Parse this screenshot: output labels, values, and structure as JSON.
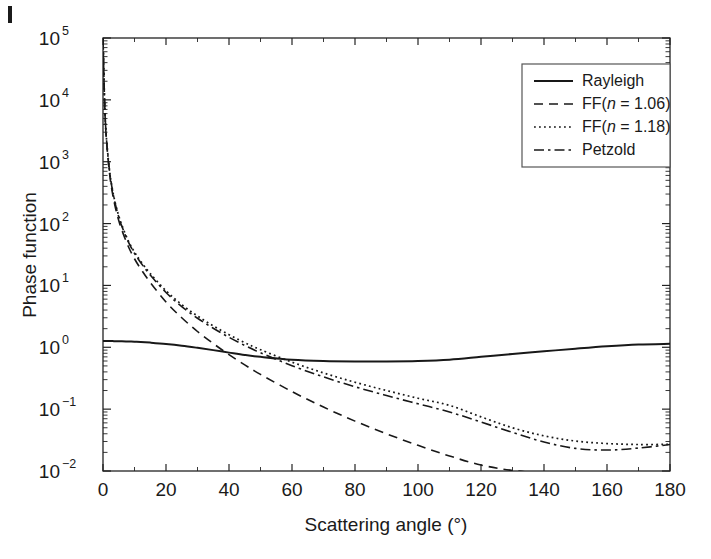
{
  "figure": {
    "background": "#ffffff",
    "ink_color": "#181818"
  },
  "axes": {
    "x_title": "Scattering angle (°)",
    "y_title": "Phase function",
    "x_ticks": [
      "0",
      "20",
      "40",
      "60",
      "80",
      "100",
      "120",
      "140",
      "160",
      "180"
    ],
    "y_ticks": [
      "10-2",
      "10-1",
      "100",
      "101",
      "102",
      "103",
      "104",
      "105"
    ],
    "y_tick_base": "10",
    "y_tick_exponents": [
      "−2",
      "−1",
      "0",
      "1",
      "2",
      "3",
      "4",
      "5"
    ]
  },
  "legend": {
    "position": "top-right",
    "items": [
      {
        "label": "Rayleigh",
        "style": "solid"
      },
      {
        "label": "FF(n = 1.06)",
        "style": "dashed",
        "label_pre": "FF(",
        "label_italic": "n",
        "label_post": " = 1.06)"
      },
      {
        "label": "FF(n = 1.18)",
        "style": "dotted",
        "label_pre": "FF(",
        "label_italic": "n",
        "label_post": " = 1.18)"
      },
      {
        "label": "Petzold",
        "style": "dashdot"
      }
    ]
  },
  "chart_data": {
    "type": "line",
    "title": "",
    "xlabel": "Scattering angle (°)",
    "ylabel": "Phase function",
    "xlim": [
      0,
      180
    ],
    "ylim": [
      0.01,
      100000
    ],
    "yscale": "log",
    "xscale": "linear",
    "grid": false,
    "legend_position": "top-right",
    "x": [
      0,
      0.5,
      1,
      2,
      3,
      4,
      5,
      6,
      8,
      10,
      12,
      15,
      20,
      25,
      30,
      35,
      40,
      45,
      50,
      60,
      70,
      80,
      90,
      100,
      110,
      120,
      130,
      140,
      150,
      160,
      170,
      180
    ],
    "series": [
      {
        "name": "Rayleigh",
        "style": "solid",
        "values": [
          1.26,
          1.26,
          1.26,
          1.26,
          1.26,
          1.25,
          1.25,
          1.25,
          1.24,
          1.23,
          1.22,
          1.19,
          1.13,
          1.06,
          0.98,
          0.9,
          0.82,
          0.75,
          0.7,
          0.63,
          0.6,
          0.59,
          0.59,
          0.6,
          0.63,
          0.7,
          0.78,
          0.86,
          0.95,
          1.04,
          1.11,
          1.14
        ]
      },
      {
        "name": "FF(n = 1.06)",
        "style": "dashed",
        "values": [
          100000,
          9500,
          2600,
          700,
          310,
          175,
          112,
          78,
          43,
          27,
          18.5,
          11.2,
          5.4,
          3.0,
          1.8,
          1.15,
          0.76,
          0.52,
          0.365,
          0.192,
          0.108,
          0.064,
          0.04,
          0.026,
          0.0175,
          0.0125,
          0.0102,
          0.0092,
          0.0086,
          0.0083,
          0.0082,
          0.0082
        ]
      },
      {
        "name": "FF(n = 1.18)",
        "style": "dotted",
        "values": [
          100000,
          9800,
          2800,
          780,
          355,
          205,
          133,
          94,
          53,
          34.5,
          24.5,
          15.6,
          8.2,
          4.9,
          3.2,
          2.22,
          1.6,
          1.19,
          0.915,
          0.575,
          0.385,
          0.272,
          0.2,
          0.15,
          0.115,
          0.075,
          0.05,
          0.037,
          0.0305,
          0.0278,
          0.0268,
          0.027
        ]
      },
      {
        "name": "Petzold",
        "style": "dashdot",
        "values": [
          100000,
          9700,
          2750,
          760,
          345,
          198,
          128,
          90,
          51,
          33.0,
          23.3,
          14.7,
          7.7,
          4.55,
          2.95,
          2.03,
          1.45,
          1.07,
          0.815,
          0.505,
          0.332,
          0.23,
          0.166,
          0.122,
          0.09,
          0.062,
          0.042,
          0.0295,
          0.0232,
          0.0218,
          0.0235,
          0.0268
        ]
      }
    ],
    "annotations": [
      {
        "text": "Rayleigh minimum near 90 degrees",
        "x": 90,
        "y": 0.59
      },
      {
        "text": "Rayleigh crosses FF(n = 1.06) near 21 degrees",
        "x": 21,
        "y": 1.12
      },
      {
        "text": "Rayleigh crosses FF(n = 1.18) and Petzold near 28 degrees",
        "x": 28,
        "y": 1.0
      }
    ]
  }
}
